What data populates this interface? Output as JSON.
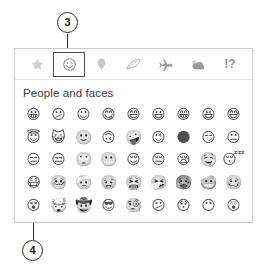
{
  "callouts": [
    {
      "number": "3",
      "target": "emoji-category-smiley-button"
    },
    {
      "number": "4",
      "target": "emoji-first-cell"
    }
  ],
  "panel": {
    "section_heading": "People and faces",
    "categories": [
      {
        "name": "star-icon",
        "label": "Favorites",
        "selected": false
      },
      {
        "name": "smiley-icon",
        "label": "Smiley faces",
        "selected": true
      },
      {
        "name": "balloon-icon",
        "label": "Celebration",
        "selected": false
      },
      {
        "name": "pizza-icon",
        "label": "Food",
        "selected": false
      },
      {
        "name": "airplane-icon",
        "label": "Transport",
        "selected": false
      },
      {
        "name": "cloud-icon",
        "label": "Weather",
        "selected": false
      },
      {
        "name": "symbols-icon",
        "label": "Symbols",
        "glyph": "!?",
        "selected": false
      }
    ],
    "emoji_rows": [
      [
        "😀",
        "😕",
        "☺",
        "😋",
        "😄",
        "😃",
        "😁",
        "😆",
        "😅"
      ],
      [
        "😇",
        "😺",
        "🙂",
        "🙃",
        "🤪",
        "😉",
        "🌑",
        "😏",
        "😐"
      ],
      [
        "😑",
        "😒",
        "🙄",
        "😬",
        "😌",
        "😔",
        "😪",
        "🤤",
        "😴"
      ],
      [
        "😷",
        "🤒",
        "🤕",
        "🤢",
        "🤮",
        "🤧",
        "🥵",
        "🥶",
        "🥴"
      ],
      [
        "😵",
        "🤯",
        "🤠",
        "😎",
        "🧐",
        "😕",
        "😯",
        "😶",
        "😲"
      ]
    ]
  },
  "colors": {
    "panel_border": "#c9c9c9",
    "selection_border": "#4a4a4a",
    "icon_inactive": "#adadad",
    "heading_text": "#3a3a3a",
    "callout_stroke": "#2b2b2b"
  }
}
